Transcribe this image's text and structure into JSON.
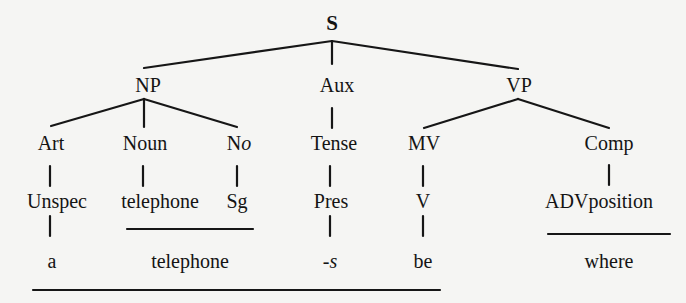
{
  "tree": {
    "root": "S",
    "level1": {
      "np": "NP",
      "aux": "Aux",
      "vp": "VP"
    },
    "level2": {
      "art": "Art",
      "noun": "Noun",
      "no_pre": "N",
      "no_it": "o",
      "tense": "Tense",
      "mv": "MV",
      "comp": "Comp"
    },
    "level3": {
      "unspec": "Unspec",
      "telephone": "telephone",
      "sg": "Sg",
      "pres": "Pres",
      "v": "V",
      "advposition": "ADVposition"
    },
    "level4": {
      "a": "a",
      "telephone": "telephone",
      "s": "-s",
      "be": "be",
      "where": "where"
    }
  }
}
